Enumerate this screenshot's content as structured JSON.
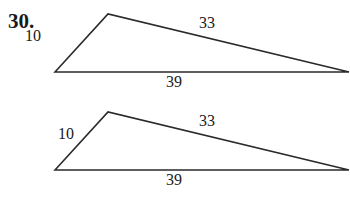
{
  "problem_number": "30.",
  "figures": [
    {
      "name": "triangle-1",
      "sides": {
        "left": "10",
        "top": "33",
        "bottom": "39"
      },
      "vertices": {
        "left": [
          55,
          72
        ],
        "top": [
          108,
          14
        ],
        "right": [
          349,
          72
        ]
      }
    },
    {
      "name": "triangle-2",
      "sides": {
        "left": "10",
        "top": "33",
        "bottom": "39"
      },
      "vertices": {
        "left": [
          55,
          170
        ],
        "top": [
          108,
          112
        ],
        "right": [
          349,
          170
        ]
      }
    }
  ],
  "colors": {
    "stroke": "#2a2a2a",
    "text": "#1a1a1a",
    "background": "#ffffff"
  }
}
